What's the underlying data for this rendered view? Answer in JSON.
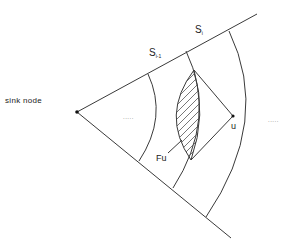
{
  "diagram": {
    "type": "sector diagram",
    "labels": {
      "sink_node": "sink node",
      "s_prev_main": "S",
      "s_prev_sub": "i-1",
      "s_curr_main": "S",
      "s_curr_sub": "i",
      "forwarding_area": "Fu",
      "node_u": "u",
      "ellipsis_inner": ".....",
      "ellipsis_outer": "....."
    },
    "nodes": [
      {
        "id": "sink",
        "label": "sink node",
        "x": 77,
        "y": 112
      },
      {
        "id": "u",
        "label": "u",
        "x": 233,
        "y": 116
      }
    ],
    "regions": [
      {
        "id": "S_i-1",
        "description": "annulus band between arc 1 and arc 2"
      },
      {
        "id": "S_i",
        "description": "annulus band between arc 2 and arc 3"
      },
      {
        "id": "Fu",
        "description": "hatched lens-shaped forwarding area",
        "fill": "hatched"
      }
    ],
    "colors": {
      "stroke": "#3a3a3a",
      "background": "#ffffff"
    }
  }
}
